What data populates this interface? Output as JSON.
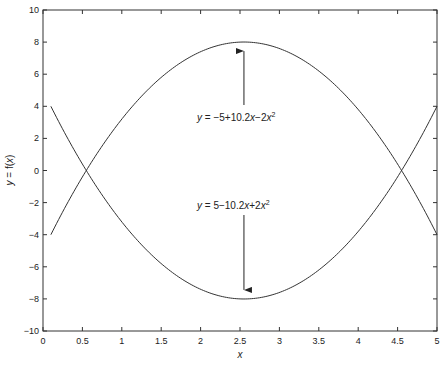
{
  "chart_data": {
    "type": "line",
    "title": "",
    "xlabel": "x",
    "ylabel": "y = f(x)",
    "xlim": [
      0,
      5
    ],
    "ylim": [
      -10,
      10
    ],
    "x_ticks": [
      "0",
      "0.5",
      "1",
      "1.5",
      "2",
      "2.5",
      "3",
      "3.5",
      "4",
      "4.5",
      "5"
    ],
    "y_ticks": [
      "10",
      "8",
      "6",
      "4",
      "2",
      "0",
      "-2",
      "-4",
      "-6",
      "-8",
      "-10"
    ],
    "grid": false,
    "legend": null,
    "series": [
      {
        "name": "y = -5+10.2x-2x^2",
        "x": [
          0.1,
          0.5,
          1.0,
          1.5,
          2.0,
          2.55,
          3.0,
          3.5,
          4.0,
          4.5,
          5.0
        ],
        "values": [
          -4.0,
          -0.4,
          3.2,
          5.8,
          7.4,
          8.0,
          7.6,
          6.2,
          3.8,
          0.4,
          -4.0
        ]
      },
      {
        "name": "y = 5-10.2x+2x^2",
        "x": [
          0.1,
          0.5,
          1.0,
          1.5,
          2.0,
          2.55,
          3.0,
          3.5,
          4.0,
          4.5,
          5.0
        ],
        "values": [
          4.0,
          0.4,
          -3.2,
          -5.8,
          -7.4,
          -8.0,
          -7.6,
          -6.2,
          -3.8,
          -0.4,
          4.0
        ]
      }
    ],
    "annotations": [
      {
        "text_prefix": "y",
        "text_body": " = −5+10.2",
        "text_x": "x",
        "text_mid": "−2",
        "text_x2": "x",
        "text_sup": "2",
        "arrow_to": [
          2.55,
          8
        ]
      },
      {
        "text_prefix": "y",
        "text_body": " = 5−10.2",
        "text_x": "x",
        "text_mid": "+2",
        "text_x2": "x",
        "text_sup": "2",
        "arrow_to": [
          2.55,
          -8
        ]
      }
    ]
  },
  "colors": {
    "line": "#333333",
    "axis": "#333333",
    "background": "#ffffff"
  }
}
